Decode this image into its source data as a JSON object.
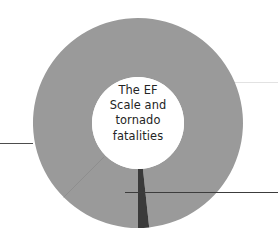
{
  "figure": {
    "background_color": "#ffffff",
    "width": 278,
    "height": 243
  },
  "center_label": {
    "lines": [
      "The EF",
      "Scale and",
      "tornado",
      "fatalities"
    ],
    "text": "The EF Scale and tornado fatalities",
    "color": "#242424"
  },
  "leader_lines": [
    {
      "name": "left-leader-line",
      "color": "#4d4d4d",
      "x1": 0,
      "y1": 143.5,
      "x2": 33,
      "y2": 143.5
    },
    {
      "name": "right-upper-leader-line",
      "color": "#e2e2e2",
      "x1": 232,
      "y1": 82.5,
      "x2": 278,
      "y2": 82.5
    },
    {
      "name": "right-lower-leader-line",
      "color": "#3c3c3c",
      "x1": 125,
      "y1": 192.5,
      "x2": 278,
      "y2": 192.5
    }
  ],
  "chart_data": {
    "type": "pie",
    "title": "The EF Scale and tornado fatalities",
    "subtitle": "",
    "xlabel": "",
    "ylabel": "",
    "donut": true,
    "legend_position": "none",
    "grid": false,
    "center_x": 138,
    "center_y": 123,
    "outer_radius": 105,
    "inner_radius": 46,
    "start_angle_deg": 225,
    "categories": [
      "Major slice",
      "Minor slice"
    ],
    "values": [
      98.3,
      1.7
    ],
    "colors": [
      "#9a9a9a",
      "#3a3a3a"
    ],
    "series": [
      {
        "name": "share",
        "values": [
          98.3,
          1.7
        ]
      }
    ],
    "slices": [
      {
        "label": "Major slice",
        "value": 98.3,
        "color": "#9a9a9a",
        "start_angle_deg": 186.2,
        "end_angle_deg": 180.1
      },
      {
        "label": "Minor slice",
        "value": 1.7,
        "color": "#3a3a3a",
        "start_angle_deg": 180.1,
        "end_angle_deg": 186.2
      }
    ]
  }
}
